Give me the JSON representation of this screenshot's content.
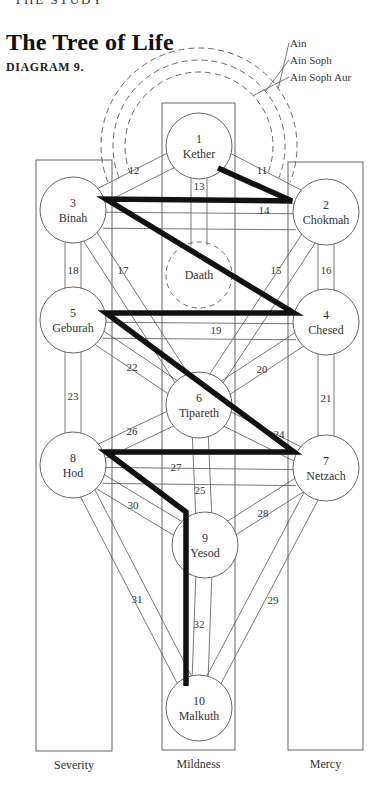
{
  "header": {
    "running_head": "THE STUDY"
  },
  "title": "The Tree of Life",
  "subtitle": "DIAGRAM 9.",
  "veils": [
    {
      "label": "Ain",
      "r": 98
    },
    {
      "label": "Ain Soph",
      "r": 86
    },
    {
      "label": "Ain Soph Aur",
      "r": 74
    }
  ],
  "pillars": [
    {
      "id": "severity",
      "label": "Severity",
      "x": 36,
      "y": 160,
      "w": 76,
      "h": 591
    },
    {
      "id": "mildness",
      "label": "Mildness",
      "x": 162,
      "y": 103,
      "w": 73,
      "h": 647
    },
    {
      "id": "mercy",
      "label": "Mercy",
      "x": 288,
      "y": 162,
      "w": 75,
      "h": 588
    }
  ],
  "sephiroth": [
    {
      "n": "1",
      "name": "Kether",
      "x": 199,
      "y": 146
    },
    {
      "n": "2",
      "name": "Chokmah",
      "x": 326,
      "y": 212
    },
    {
      "n": "3",
      "name": "Binah",
      "x": 73,
      "y": 210
    },
    {
      "n": "",
      "name": "Daath",
      "x": 199,
      "y": 275,
      "dashed": true
    },
    {
      "n": "4",
      "name": "Chesed",
      "x": 326,
      "y": 322
    },
    {
      "n": "5",
      "name": "Geburah",
      "x": 73,
      "y": 320
    },
    {
      "n": "6",
      "name": "Tipareth",
      "x": 199,
      "y": 405
    },
    {
      "n": "7",
      "name": "Netzach",
      "x": 326,
      "y": 468
    },
    {
      "n": "8",
      "name": "Hod",
      "x": 73,
      "y": 465
    },
    {
      "n": "9",
      "name": "Yesod",
      "x": 205,
      "y": 545
    },
    {
      "n": "10",
      "name": "Malkuth",
      "x": 199,
      "y": 708
    }
  ],
  "paths": [
    {
      "n": "11",
      "from": 0,
      "to": 1,
      "lx": 262,
      "ly": 170
    },
    {
      "n": "12",
      "from": 0,
      "to": 2,
      "lx": 134,
      "ly": 170
    },
    {
      "n": "13",
      "from": 0,
      "to": 3,
      "lx": 199,
      "ly": 186
    },
    {
      "n": "14",
      "from": 2,
      "to": 1,
      "lx": 264,
      "ly": 210,
      "offset": 10
    },
    {
      "n": "15",
      "from": 1,
      "to": 6,
      "lx": 276,
      "ly": 270
    },
    {
      "n": "16",
      "from": 1,
      "to": 4,
      "lx": 326,
      "ly": 270
    },
    {
      "n": "17",
      "from": 2,
      "to": 6,
      "lx": 123,
      "ly": 270
    },
    {
      "n": "18",
      "from": 2,
      "to": 5,
      "lx": 73,
      "ly": 270
    },
    {
      "n": "19",
      "from": 5,
      "to": 4,
      "lx": 216,
      "ly": 330,
      "offset": 10
    },
    {
      "n": "20",
      "from": 4,
      "to": 6,
      "lx": 262,
      "ly": 369
    },
    {
      "n": "21",
      "from": 4,
      "to": 7,
      "lx": 326,
      "ly": 398
    },
    {
      "n": "22",
      "from": 5,
      "to": 6,
      "lx": 132,
      "ly": 367
    },
    {
      "n": "23",
      "from": 5,
      "to": 8,
      "lx": 73,
      "ly": 396
    },
    {
      "n": "24",
      "from": 6,
      "to": 7,
      "lx": 279,
      "ly": 434
    },
    {
      "n": "25",
      "from": 6,
      "to": 9,
      "lx": 200,
      "ly": 490
    },
    {
      "n": "26",
      "from": 8,
      "to": 6,
      "lx": 132,
      "ly": 431
    },
    {
      "n": "27",
      "from": 8,
      "to": 7,
      "lx": 176,
      "ly": 467,
      "offset": 10
    },
    {
      "n": "28",
      "from": 7,
      "to": 9,
      "lx": 263,
      "ly": 513
    },
    {
      "n": "29",
      "from": 7,
      "to": 10,
      "lx": 273,
      "ly": 600
    },
    {
      "n": "30",
      "from": 8,
      "to": 9,
      "lx": 133,
      "ly": 505
    },
    {
      "n": "31",
      "from": 8,
      "to": 10,
      "lx": 137,
      "ly": 599
    },
    {
      "n": "32",
      "from": 9,
      "to": 10,
      "lx": 199,
      "ly": 624
    }
  ],
  "lightning": [
    [
      218,
      168
    ],
    [
      292,
      201
    ],
    [
      106,
      199
    ],
    [
      294,
      313
    ],
    [
      106,
      313
    ],
    [
      294,
      452
    ],
    [
      106,
      452
    ],
    [
      186,
      512
    ],
    [
      186,
      686
    ]
  ],
  "colors": {
    "line": "#555555",
    "bolt": "#111111",
    "text": "#333333"
  }
}
